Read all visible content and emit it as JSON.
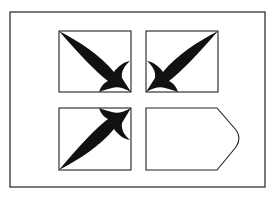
{
  "figure": {
    "colors": {
      "background": "#ffffff",
      "stroke": "#222222",
      "fill": "#111111"
    },
    "panels": [
      {
        "position": "top-left",
        "content": "leaf ornament pointing to bottom-right corner"
      },
      {
        "position": "top-right",
        "content": "leaf ornament pointing to bottom-left corner"
      },
      {
        "position": "bottom-left",
        "content": "leaf ornament pointing to top-right corner"
      },
      {
        "position": "bottom-right",
        "content": "empty pentagon tag shape pointing right"
      }
    ]
  }
}
